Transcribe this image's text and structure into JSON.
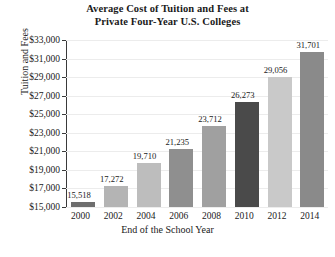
{
  "chart_data": {
    "type": "bar",
    "title": "Average Cost of Tuition and Fees at Private Four-Year U.S. Colleges",
    "title_lines": [
      "Average Cost of Tuition and Fees at",
      "Private Four-Year U.S. Colleges"
    ],
    "xlabel": "End of the School Year",
    "ylabel": "Tuition and Fees",
    "categories": [
      "2000",
      "2002",
      "2004",
      "2006",
      "2008",
      "2010",
      "2012",
      "2014"
    ],
    "values": [
      15518,
      17272,
      19710,
      21235,
      23712,
      26273,
      29056,
      31701
    ],
    "value_labels": [
      "15,518",
      "17,272",
      "19,710",
      "21,235",
      "23,712",
      "26,273",
      "29,056",
      "31,701"
    ],
    "bar_colors": [
      "#6e6e6e",
      "#b4b4b4",
      "#bdbdbd",
      "#8f8f8f",
      "#a0a0a0",
      "#4a4a4a",
      "#c9c9c9",
      "#8a8a8a"
    ],
    "ylim": [
      15000,
      33000
    ],
    "ytick_values": [
      33000,
      31000,
      29000,
      27000,
      25000,
      23000,
      21000,
      19000,
      17000,
      15000
    ],
    "ytick_labels": [
      "$33,000",
      "$31,000",
      "$29,000",
      "$27,000",
      "$25,000",
      "$23,000",
      "$21,000",
      "$19,000",
      "$17,000",
      "$15,000"
    ],
    "grid": true,
    "legend": "none",
    "axis_color": "#3a3a3a",
    "grid_color": "#ececec",
    "background": "#ffffff"
  }
}
